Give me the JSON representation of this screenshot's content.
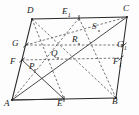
{
  "figure": {
    "type": "geometry-diagram",
    "background_color": "#fdfdfd",
    "stroke_color": "#2a2a2a",
    "dash_color": "#4a4a4a",
    "canvas": {
      "width": 139,
      "height": 115
    }
  },
  "vertices": {
    "A": {
      "label": "A",
      "x": 12,
      "y": 100,
      "sub": "",
      "lx": 5,
      "ly": 96
    },
    "B": {
      "label": "B",
      "x": 116,
      "y": 98,
      "sub": "",
      "lx": 114,
      "ly": 95
    },
    "C": {
      "label": "C",
      "x": 127,
      "y": 17,
      "sub": "",
      "lx": 124,
      "ly": 5
    },
    "D": {
      "label": "D",
      "x": 32,
      "y": 19,
      "sub": "",
      "lx": 27,
      "ly": 7
    }
  },
  "midpoints": {
    "E": {
      "label": "E",
      "sub": "",
      "x": 64,
      "y": 99,
      "lx": 56,
      "ly": 100
    },
    "E1": {
      "label": "E",
      "sub": "1",
      "x": 79,
      "y": 18,
      "lx": 62,
      "ly": 8
    },
    "F": {
      "label": "F",
      "sub": "",
      "x": 22,
      "y": 60,
      "lx": 10,
      "ly": 60
    },
    "F1": {
      "label": "F",
      "sub": "1",
      "x": 121,
      "y": 58,
      "lx": 113,
      "ly": 61
    },
    "G": {
      "label": "G",
      "sub": "",
      "x": 26,
      "y": 45,
      "lx": 13,
      "ly": 42
    },
    "G1": {
      "label": "G",
      "sub": "1",
      "x": 124,
      "y": 45,
      "lx": 117,
      "ly": 43
    }
  },
  "interior_points": {
    "P": {
      "label": "P",
      "sub": "",
      "x": 35,
      "y": 70,
      "lx": 29,
      "ly": 63
    },
    "Q": {
      "label": "Q",
      "sub": "",
      "x": 58,
      "y": 58,
      "lx": 52,
      "ly": 50
    },
    "R": {
      "label": "R",
      "sub": "",
      "x": 79,
      "y": 44,
      "lx": 72,
      "ly": 36
    },
    "S": {
      "label": "S",
      "sub": "",
      "x": 99,
      "y": 31,
      "lx": 92,
      "ly": 23
    }
  },
  "solid_segments": [
    {
      "name": "side-AB",
      "from": "A",
      "to": "B"
    },
    {
      "name": "side-BC",
      "from": "B",
      "to": "C"
    },
    {
      "name": "side-CD",
      "from": "C",
      "to": "D"
    },
    {
      "name": "side-DA",
      "from": "D",
      "to": "A"
    },
    {
      "name": "diagonal-AC",
      "from": "A",
      "to": "C"
    },
    {
      "name": "segment-A-to-F",
      "from": "A",
      "to": "F"
    },
    {
      "name": "segment-F-to-E",
      "from": "F",
      "to": "E"
    },
    {
      "name": "segment-A-to-E",
      "from": "A",
      "to": "E"
    }
  ],
  "dashed_segments": [
    {
      "name": "dashed-D-to-B",
      "from": "D",
      "to": "B"
    },
    {
      "name": "dashed-D-to-E",
      "from": "D",
      "to": "E"
    },
    {
      "name": "dashed-G-to-G1",
      "from": "G",
      "to": "G1"
    },
    {
      "name": "dashed-F-to-F1",
      "from": "F",
      "to": "F1"
    },
    {
      "name": "dashed-E1-to-A",
      "from": "E1",
      "to": "A"
    },
    {
      "name": "dashed-E1-to-B",
      "from": "E1",
      "to": "B"
    },
    {
      "name": "dashed-G-to-C",
      "from": "G",
      "to": "C"
    }
  ],
  "labels_order": [
    "D",
    "E1",
    "C",
    "G",
    "R",
    "S",
    "G1",
    "F",
    "Q",
    "F1",
    "P",
    "A",
    "E",
    "B"
  ]
}
